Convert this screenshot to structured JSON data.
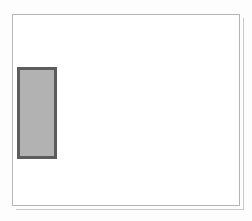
{
  "page": {
    "background_color": "#fdfdfd"
  },
  "canvas": {
    "name": "drawing-canvas",
    "background_color": "#ffffff",
    "border_color": "#b4b4b4",
    "shadow_color": "#c9c9c9",
    "x": 12,
    "y": 14,
    "width": 228,
    "height": 192
  },
  "shapes": [
    {
      "name": "rectangle",
      "type": "rectangle",
      "fill_color": "#b2b2b2",
      "border_color": "#5c5c5c",
      "border_width": 3,
      "x": 17,
      "y": 67,
      "width": 40,
      "height": 92
    }
  ]
}
